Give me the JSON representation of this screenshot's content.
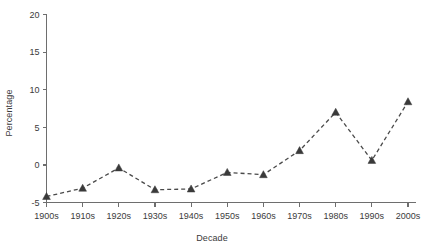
{
  "chart_data": {
    "type": "line",
    "title": "",
    "xlabel": "Decade",
    "ylabel": "Percentage",
    "categories": [
      "1900s",
      "1910s",
      "1920s",
      "1930s",
      "1940s",
      "1950s",
      "1960s",
      "1970s",
      "1980s",
      "1990s",
      "2000s"
    ],
    "values": [
      -4.2,
      -3.1,
      -0.4,
      -3.3,
      -3.2,
      -1.0,
      -1.3,
      1.9,
      7.0,
      0.6,
      8.4
    ],
    "series": [
      {
        "name": "Percentage",
        "values": [
          -4.2,
          -3.1,
          -0.4,
          -3.3,
          -3.2,
          -1.0,
          -1.3,
          1.9,
          7.0,
          0.6,
          8.4
        ]
      }
    ],
    "ylim": [
      -5,
      20
    ],
    "yticks": [
      -5,
      0,
      5,
      10,
      15,
      20
    ],
    "ytick_labels": [
      "-5",
      "0",
      "5",
      "10",
      "15",
      "20"
    ],
    "xlim": [
      0,
      10
    ],
    "grid": false,
    "legend": false,
    "legend_position": "none",
    "line_style": "dashed",
    "marker": "triangle",
    "line_color": "#4a4a4a",
    "marker_color": "#3a3a3a",
    "axis_color": "#6e6e6e",
    "background_color": "#ffffff"
  }
}
